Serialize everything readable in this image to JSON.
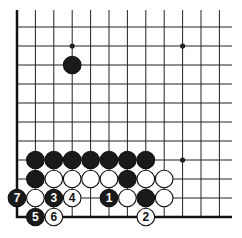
{
  "board": {
    "cols": 12,
    "rows": 11,
    "origin_x": 17,
    "origin_y": 27,
    "dx": 18.4,
    "dy": 19,
    "right_extent": 232,
    "top_extent": 10,
    "star_points": [
      [
        3,
        1
      ],
      [
        9,
        1
      ],
      [
        9,
        7
      ]
    ],
    "stones": [
      {
        "c": 3,
        "r": 2,
        "color": "black",
        "label": ""
      },
      {
        "c": 1,
        "r": 7,
        "color": "black",
        "label": ""
      },
      {
        "c": 2,
        "r": 7,
        "color": "black",
        "label": ""
      },
      {
        "c": 3,
        "r": 7,
        "color": "black",
        "label": ""
      },
      {
        "c": 4,
        "r": 7,
        "color": "black",
        "label": ""
      },
      {
        "c": 5,
        "r": 7,
        "color": "black",
        "label": ""
      },
      {
        "c": 6,
        "r": 7,
        "color": "black",
        "label": ""
      },
      {
        "c": 7,
        "r": 7,
        "color": "black",
        "label": ""
      },
      {
        "c": 1,
        "r": 8,
        "color": "black",
        "label": ""
      },
      {
        "c": 2,
        "r": 8,
        "color": "white",
        "label": ""
      },
      {
        "c": 3,
        "r": 8,
        "color": "white",
        "label": ""
      },
      {
        "c": 4,
        "r": 8,
        "color": "white",
        "label": ""
      },
      {
        "c": 5,
        "r": 8,
        "color": "white",
        "label": ""
      },
      {
        "c": 6,
        "r": 8,
        "color": "black",
        "label": ""
      },
      {
        "c": 7,
        "r": 8,
        "color": "white",
        "label": ""
      },
      {
        "c": 8,
        "r": 8,
        "color": "white",
        "label": ""
      },
      {
        "c": 0,
        "r": 9,
        "color": "black",
        "label": "7"
      },
      {
        "c": 1,
        "r": 9,
        "color": "white",
        "label": ""
      },
      {
        "c": 2,
        "r": 9,
        "color": "black",
        "label": "3"
      },
      {
        "c": 3,
        "r": 9,
        "color": "white",
        "label": "4"
      },
      {
        "c": 5,
        "r": 9,
        "color": "black",
        "label": "1"
      },
      {
        "c": 6,
        "r": 9,
        "color": "white",
        "label": ""
      },
      {
        "c": 7,
        "r": 9,
        "color": "black",
        "label": ""
      },
      {
        "c": 8,
        "r": 9,
        "color": "white",
        "label": ""
      },
      {
        "c": 1,
        "r": 10,
        "color": "black",
        "label": "5"
      },
      {
        "c": 2,
        "r": 10,
        "color": "white",
        "label": "6"
      },
      {
        "c": 7,
        "r": 10,
        "color": "white",
        "label": "2"
      }
    ]
  }
}
